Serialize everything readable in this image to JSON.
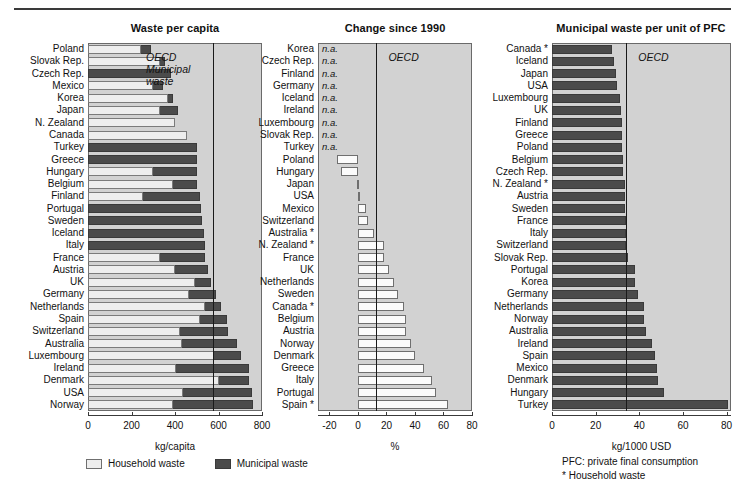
{
  "figure": {
    "background": "#ffffff",
    "plot_background": "#d2d2d2",
    "household_color": "#eeeeee",
    "municipal_color": "#4b4b4b",
    "change_bar_color": "#fbfbfb",
    "oecd_marker_label": "OECD",
    "na_text": "n.a."
  },
  "legend": {
    "household_label": "Household waste",
    "municipal_label": "Municipal waste"
  },
  "notes": {
    "pfc": "PFC: private final consumption",
    "household": "* Household waste"
  },
  "annotations": {
    "left_oecd_line1": "OECD",
    "left_oecd_line2": "Municipal",
    "left_oecd_line3": "waste"
  },
  "chart_data": [
    {
      "id": "waste-per-capita",
      "type": "bar",
      "orientation": "horizontal",
      "stacked": true,
      "title": "Waste per capita",
      "xlabel": "kg/capita",
      "ylabel": "",
      "xlim": [
        0,
        800
      ],
      "xticks": [
        0,
        200,
        400,
        600,
        800
      ],
      "grid": false,
      "reference_line": {
        "label": "OECD",
        "value": 575
      },
      "series": [
        {
          "name": "Household waste",
          "color": "#eeeeee"
        },
        {
          "name": "Municipal waste",
          "color": "#4b4b4b"
        }
      ],
      "categories": [
        "Poland",
        "Slovak Rep.",
        "Czech Rep.",
        "Mexico",
        "Korea",
        "Japan",
        "N. Zealand",
        "Canada",
        "Turkey",
        "Greece",
        "Hungary",
        "Belgium",
        "Finland",
        "Portugal",
        "Sweden",
        "Iceland",
        "Italy",
        "France",
        "Austria",
        "UK",
        "Germany",
        "Netherlands",
        "Spain",
        "Switzerland",
        "Australia",
        "Luxembourg",
        "Ireland",
        "Denmark",
        "USA",
        "Norway"
      ],
      "household": [
        245,
        330,
        0,
        300,
        370,
        330,
        400,
        455,
        0,
        0,
        300,
        390,
        255,
        0,
        0,
        0,
        0,
        330,
        400,
        490,
        465,
        540,
        515,
        425,
        430,
        580,
        405,
        600,
        435,
        390
      ],
      "municipal": [
        290,
        355,
        380,
        345,
        390,
        415,
        400,
        455,
        500,
        500,
        500,
        500,
        515,
        520,
        525,
        535,
        540,
        540,
        550,
        565,
        590,
        610,
        640,
        645,
        685,
        705,
        740,
        740,
        755,
        760
      ]
    },
    {
      "id": "change-since-1990",
      "type": "bar",
      "orientation": "horizontal",
      "title": "Change since 1990",
      "xlabel": "%",
      "ylabel": "",
      "xlim": [
        -28,
        80
      ],
      "xticks": [
        -20,
        0,
        20,
        40,
        60,
        80
      ],
      "grid": false,
      "reference_line": {
        "label": "OECD",
        "value": 13
      },
      "categories": [
        "Korea",
        "Czech Rep.",
        "Finland",
        "Germany",
        "Iceland",
        "Ireland",
        "Luxembourg",
        "Slovak Rep.",
        "Turkey",
        "Poland",
        "Hungary",
        "Japan",
        "USA",
        "Mexico",
        "Switzerland",
        "Australia *",
        "N. Zealand *",
        "France",
        "UK",
        "Netherlands",
        "Sweden",
        "Canada *",
        "Belgium",
        "Austria",
        "Norway",
        "Denmark",
        "Greece",
        "Italy",
        "Portugal",
        "Spain *"
      ],
      "values": [
        null,
        null,
        null,
        null,
        null,
        null,
        null,
        null,
        null,
        -15,
        -12,
        -1,
        0,
        6,
        7,
        11,
        18,
        18,
        22,
        25,
        28,
        32,
        34,
        34,
        37,
        40,
        46,
        52,
        55,
        63
      ],
      "na_categories": [
        "Korea",
        "Czech Rep.",
        "Finland",
        "Germany",
        "Iceland",
        "Ireland",
        "Luxembourg",
        "Slovak Rep.",
        "Turkey"
      ]
    },
    {
      "id": "municipal-waste-per-unit-pfc",
      "type": "bar",
      "orientation": "horizontal",
      "title": "Municipal waste per unit of PFC",
      "xlabel": "kg/1000 USD",
      "ylabel": "",
      "xlim": [
        0,
        82
      ],
      "xticks": [
        0,
        20,
        40,
        60,
        80
      ],
      "grid": false,
      "reference_line": {
        "label": "OECD",
        "value": 34
      },
      "categories": [
        "Canada *",
        "Iceland",
        "Japan",
        "USA",
        "Luxembourg",
        "UK",
        "Finland",
        "Greece",
        "Poland",
        "Belgium",
        "Czech Rep.",
        "N. Zealand *",
        "Austria",
        "Sweden",
        "France",
        "Italy",
        "Switzerland",
        "Slovak Rep.",
        "Portugal",
        "Korea",
        "Germany",
        "Netherlands",
        "Norway",
        "Australia",
        "Ireland",
        "Spain",
        "Mexico",
        "Denmark",
        "Hungary",
        "Turkey"
      ],
      "values": [
        27.5,
        28.5,
        29.5,
        30.0,
        31.0,
        31.5,
        32.0,
        32.0,
        32.0,
        32.5,
        32.5,
        33.5,
        33.5,
        33.5,
        34.0,
        34.0,
        34.0,
        35.0,
        38.0,
        38.0,
        39.5,
        42.0,
        42.0,
        43.0,
        46.0,
        47.0,
        48.0,
        48.5,
        51.5,
        80.5
      ]
    }
  ]
}
